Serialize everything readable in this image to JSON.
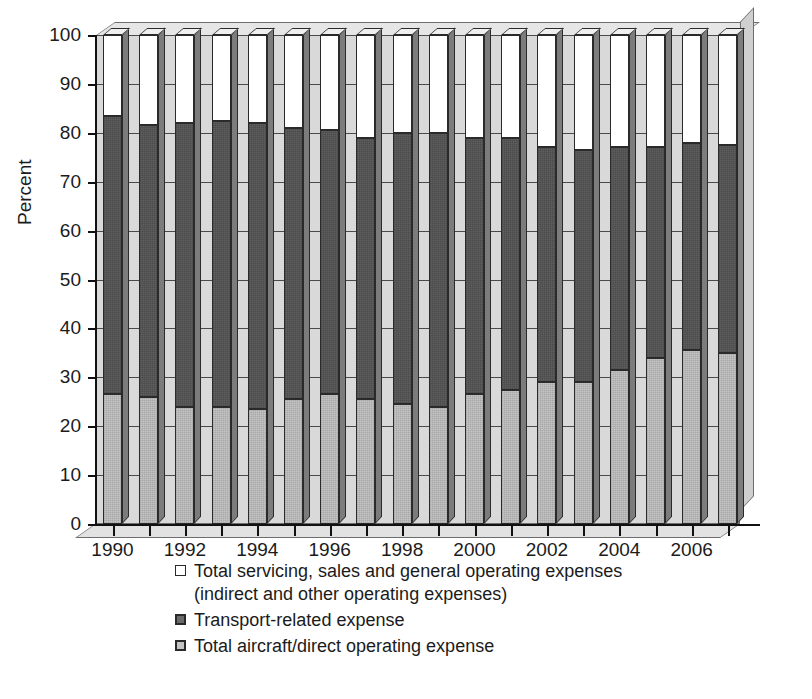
{
  "chart_data": {
    "type": "bar",
    "subtype": "stacked-percent-3d",
    "title": "",
    "xlabel": "",
    "ylabel": "Percent",
    "ylim": [
      0,
      100
    ],
    "ytick_values": [
      0,
      10,
      20,
      30,
      40,
      50,
      60,
      70,
      80,
      90,
      100
    ],
    "ytick_labels": [
      "0",
      "10",
      "20",
      "30",
      "40",
      "50",
      "60",
      "70",
      "80",
      "90",
      "100"
    ],
    "grid": true,
    "grid_axis": "y",
    "legend_position": "below-axes-left",
    "categories": [
      1990,
      1991,
      1992,
      1993,
      1994,
      1995,
      1996,
      1997,
      1998,
      1999,
      2000,
      2001,
      2002,
      2003,
      2004,
      2005,
      2006,
      2007
    ],
    "xtick_labels": [
      "1990",
      "1992",
      "1994",
      "1996",
      "1998",
      "2000",
      "2002",
      "2004",
      "2006"
    ],
    "xtick_label_years": [
      1990,
      1992,
      1994,
      1996,
      1998,
      2000,
      2002,
      2004,
      2006
    ],
    "series": [
      {
        "name": "Total aircraft/direct operating expense",
        "key": "aircraft_direct",
        "color": "#c4c4c4",
        "stack_order": 0,
        "values": [
          26.5,
          26.0,
          24.0,
          24.0,
          23.5,
          25.5,
          26.5,
          25.5,
          24.5,
          24.0,
          26.5,
          27.5,
          29.0,
          29.0,
          31.5,
          34.0,
          35.5,
          35.0
        ]
      },
      {
        "name": "Transport-related expense",
        "key": "transport_related",
        "color": "#5e5e5e",
        "stack_order": 1,
        "values": [
          57.0,
          55.5,
          58.0,
          58.5,
          58.5,
          55.5,
          54.0,
          53.5,
          55.5,
          56.0,
          52.5,
          51.5,
          48.0,
          47.5,
          45.5,
          43.0,
          42.5,
          42.5
        ]
      },
      {
        "name": "Total servicing, sales and general operating expenses",
        "key": "servicing_sales_general",
        "color": "#ffffff",
        "stack_order": 2,
        "values": [
          16.5,
          18.5,
          18.0,
          17.5,
          18.0,
          19.0,
          19.5,
          21.0,
          20.0,
          20.0,
          21.0,
          21.0,
          23.0,
          23.5,
          23.0,
          23.0,
          22.0,
          22.5
        ]
      }
    ],
    "cumulative_tops": {
      "aircraft_direct": [
        26.5,
        26.0,
        24.0,
        24.0,
        23.5,
        25.5,
        26.5,
        25.5,
        24.5,
        24.0,
        26.5,
        27.5,
        29.0,
        29.0,
        31.5,
        34.0,
        35.5,
        35.0
      ],
      "transport_related": [
        83.5,
        81.5,
        82.0,
        82.5,
        82.0,
        81.0,
        80.5,
        79.0,
        80.0,
        80.0,
        79.0,
        79.0,
        77.0,
        76.5,
        77.0,
        77.0,
        78.0,
        77.5
      ],
      "servicing_sales_general": [
        100,
        100,
        100,
        100,
        100,
        100,
        100,
        100,
        100,
        100,
        100,
        100,
        100,
        100,
        100,
        100,
        100,
        100
      ]
    }
  },
  "legend": {
    "items": [
      {
        "swatch": "white",
        "label": "Total servicing, sales and general operating expenses",
        "continuation": "(indirect and other operating expenses)"
      },
      {
        "swatch": "dark",
        "label": "Transport-related expense",
        "continuation": ""
      },
      {
        "swatch": "light",
        "label": "Total aircraft/direct operating expense",
        "continuation": ""
      }
    ]
  },
  "axis": {
    "y_title": "Percent"
  },
  "colors": {
    "segment_white": "#ffffff",
    "segment_dark": "#5e5e5e",
    "segment_light": "#c4c4c4",
    "back_wall": "#d9d9d9",
    "outline": "#2a2a2a",
    "text": "#1b1b1b"
  }
}
